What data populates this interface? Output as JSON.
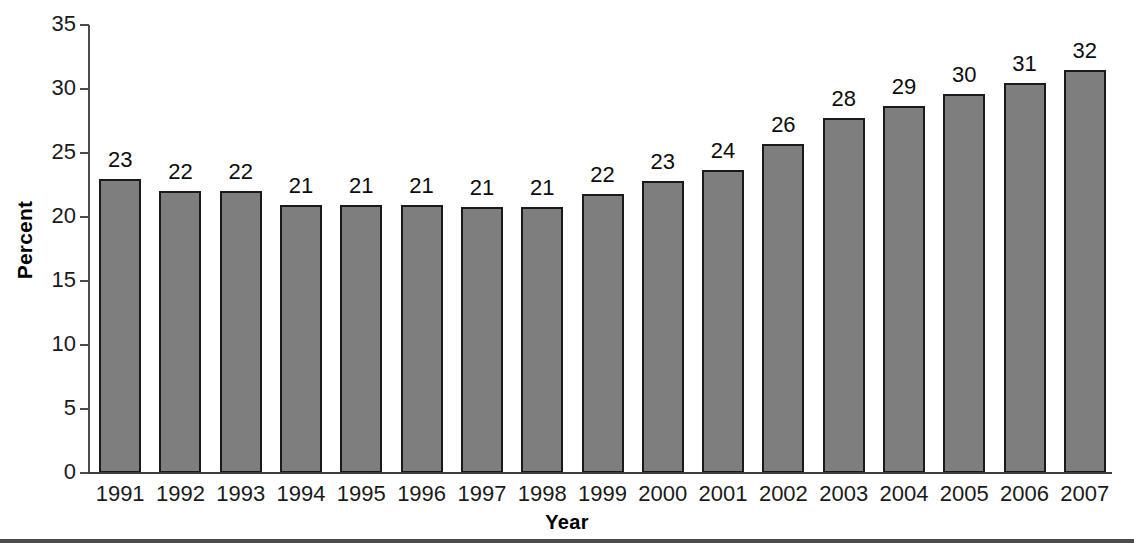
{
  "chart_data": {
    "type": "bar",
    "title": "",
    "subtitle": "",
    "xlabel": "Year",
    "ylabel": "Percent",
    "categories": [
      "1991",
      "1992",
      "1993",
      "1994",
      "1995",
      "1996",
      "1997",
      "1998",
      "1999",
      "2000",
      "2001",
      "2002",
      "2003",
      "2004",
      "2005",
      "2006",
      "2007"
    ],
    "values": [
      23.0,
      22.0,
      22.0,
      20.9,
      20.9,
      20.9,
      20.8,
      20.8,
      21.8,
      22.8,
      23.7,
      25.7,
      27.7,
      28.7,
      29.6,
      30.5,
      31.5
    ],
    "data_labels": [
      "23",
      "22",
      "22",
      "21",
      "21",
      "21",
      "21",
      "21",
      "22",
      "23",
      "24",
      "26",
      "28",
      "29",
      "30",
      "31",
      "32"
    ],
    "ylim": [
      0,
      35
    ],
    "yticks": [
      0,
      5,
      10,
      15,
      20,
      25,
      30,
      35
    ],
    "ytick_labels": [
      "0",
      "5",
      "10",
      "15",
      "20",
      "25",
      "30",
      "35"
    ],
    "grid": false,
    "legend": null,
    "series_color": "#7e7e7e",
    "bar_outline_color": "#1a1a1a",
    "axis_color": "#3d3d3d"
  }
}
